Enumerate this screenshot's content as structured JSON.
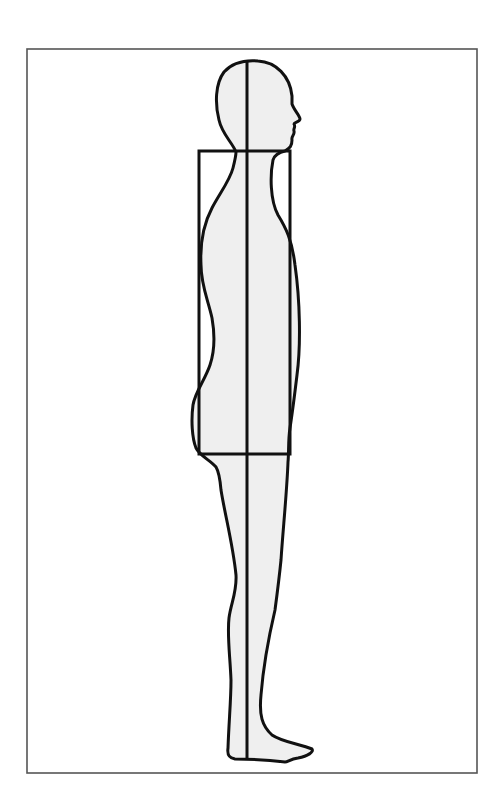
{
  "diagram": {
    "colors": {
      "background": "#ffffff",
      "frame": "#555555",
      "outline": "#111111",
      "body_fill": "#efefef"
    },
    "elements": {
      "frame": {
        "x": 27,
        "y": 49,
        "width": 450,
        "height": 724
      },
      "body_axis": {
        "x": 247,
        "y1": 62,
        "y2": 758
      },
      "torso_box": {
        "x": 199,
        "y": 151,
        "width": 91,
        "height": 303
      },
      "figure": {
        "orientation": "profile-facing-right",
        "head_top_y": 61,
        "feet_y": 762
      }
    },
    "labels": {
      "figure": "human-silhouette-side-view"
    }
  }
}
